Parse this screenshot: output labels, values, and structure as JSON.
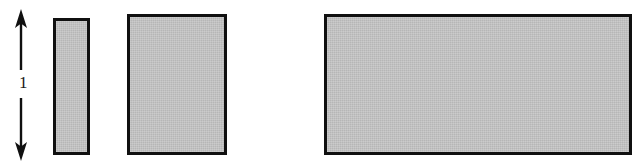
{
  "figure": {
    "type": "diagram",
    "background_color": "#ffffff",
    "width": 643,
    "height": 167,
    "annotation": {
      "name": "height-dimension-arrow",
      "label": "1",
      "orientation": "vertical",
      "arrow_style": "double-headed",
      "color": "#101010",
      "x": 21,
      "y_top": 10,
      "y_bottom": 160
    },
    "blocks": [
      {
        "name": "narrow-block",
        "label": "",
        "fill_color": "#c2c2c2",
        "border_color": "#101010",
        "border_width": 3,
        "x": 53,
        "y": 18,
        "width": 37,
        "height": 137
      },
      {
        "name": "square-block",
        "label": "",
        "fill_color": "#c2c2c2",
        "border_color": "#101010",
        "border_width": 3,
        "x": 127,
        "y": 14,
        "width": 100,
        "height": 141
      },
      {
        "name": "wide-block",
        "label": "",
        "fill_color": "#c2c2c2",
        "border_color": "#101010",
        "border_width": 3,
        "x": 324,
        "y": 14,
        "width": 308,
        "height": 141
      }
    ]
  }
}
